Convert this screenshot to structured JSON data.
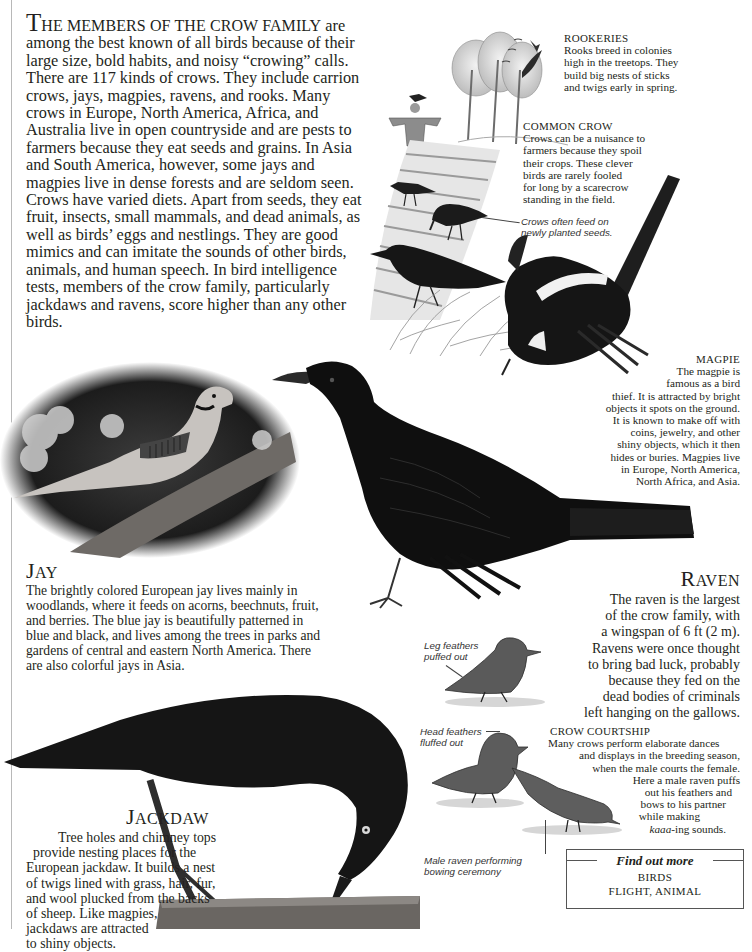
{
  "intro": {
    "lead_cap": "T",
    "lead_smallcaps": "HE MEMBERS OF THE CROW FAMILY",
    "text": " are among the best known of all birds because of their large size, bold habits, and noisy “crowing” calls. There are 117 kinds of crows. They include carrion crows, jays, magpies, ravens, and rooks. Many crows in Europe, North America, Africa, and Australia live in open countryside and are pests to farmers because they eat seeds and grains. In Asia and South America, however, some jays and magpies live in dense forests and are seldom seen. Crows have varied diets. Apart from seeds, they eat fruit, insects, small mammals, and dead animals, as well as birds’ eggs and nestlings. They are good mimics and can imitate the sounds of other birds, animals, and human speech. In bird intelligence tests, members of the crow family, particularly jackdaws and ravens, score higher than any other birds."
  },
  "rookeries": {
    "heading": "ROOKERIES",
    "lines": [
      "Rooks breed in colonies",
      "high in the treetops. They",
      "build big nests of sticks",
      "and twigs early in spring."
    ]
  },
  "common_crow": {
    "heading": "COMMON CROW",
    "lines": [
      "Crows can be a nuisance to",
      "farmers because they spoil",
      "their crops. These clever",
      "birds are rarely fooled",
      "for long by a scarecrow",
      "standing in the field."
    ],
    "label_lines": [
      "Crows often feed on",
      "newly planted seeds."
    ]
  },
  "magpie": {
    "heading": "MAGPIE",
    "lines": [
      "The magpie is",
      "famous as a bird",
      "thief. It is attracted by bright",
      "objects it spots on the ground.",
      "It is known to make off with",
      "coins, jewelry, and other",
      "shiny objects, which it then",
      "hides or buries. Magpies live",
      "in Europe, North America,",
      "North Africa, and Asia."
    ]
  },
  "jay": {
    "title_cap": "J",
    "title_sc": "AY",
    "lines": [
      "The brightly colored European jay lives mainly in",
      "woodlands, where it feeds on acorns, beechnuts, fruit,",
      "and berries. The blue jay is beautifully patterned in",
      "blue and black, and lives among the trees in parks and",
      "gardens of central and eastern North America. There",
      "are also colorful jays in Asia."
    ]
  },
  "raven": {
    "title_cap": "R",
    "title_sc": "AVEN",
    "lines": [
      "The raven is the largest",
      "of the crow family, with",
      "a wingspan of 6 ft (2 m).",
      "Ravens were once thought",
      "to bring bad luck, probably",
      "because they fed on the",
      "dead bodies of criminals",
      "left hanging on the gallows."
    ]
  },
  "courtship": {
    "heading": "CROW COURTSHIP",
    "lines": [
      "Many crows perform elaborate dances",
      "and displays in the breeding season,",
      "when the male courts the female.",
      "Here a male raven puffs",
      "out his feathers and",
      "bows to his partner",
      "while making"
    ],
    "last_line_italic": "kaaa",
    "last_line_rest": "-ing sounds.",
    "labels": {
      "leg": [
        "Leg feathers",
        "puffed out"
      ],
      "head": [
        "Head feathers",
        "fluffed out"
      ],
      "male": [
        "Male raven performing",
        "bowing ceremony"
      ]
    }
  },
  "jackdaw": {
    "title_cap": "J",
    "title_sc": "ACKDAW",
    "lines": [
      "Tree holes and chimney tops",
      "provide nesting places for the",
      "European jackdaw. It builds a nest",
      "of twigs lined with grass, hair, fur,",
      "and wool plucked from the backs",
      "of sheep. Like magpies,",
      "jackdaws are attracted",
      "to shiny objects."
    ]
  },
  "find_out_more": {
    "title": "Find out more",
    "items": [
      "BIRDS",
      "FLIGHT, ANIMAL"
    ]
  },
  "illustrations": {
    "rookery_scene": "rookery-trees-icon",
    "scarecrow": "scarecrow-icon",
    "common_crows": "crow-icon",
    "magpie": "magpie-icon",
    "raven": "raven-icon",
    "jay_photo": "jay-photo",
    "courtship_ravens": "raven-sketch-icon",
    "jackdaw_photo": "jackdaw-photo"
  }
}
